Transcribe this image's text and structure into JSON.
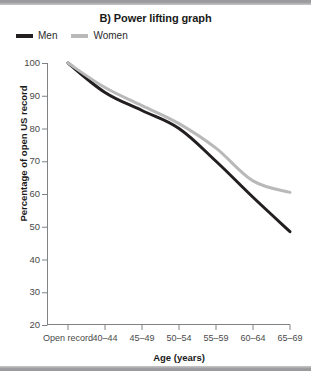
{
  "figure": {
    "background_color": "#ffffff",
    "border_bar_color": "#9b9b9e"
  },
  "title": "B) Power lifting graph",
  "legend": {
    "position": "top-left",
    "entries": [
      {
        "label": "Men",
        "color": "#231f20"
      },
      {
        "label": "Women",
        "color": "#b9b9b9"
      }
    ]
  },
  "axes": {
    "xlabel": "Age (years)",
    "ylabel": "Percentage of open US record",
    "ytick_labels": [
      "100",
      "90",
      "80",
      "70",
      "60",
      "50",
      "40",
      "30",
      "20"
    ],
    "xtick_labels": [
      "Open record",
      "40–44",
      "45–49",
      "50–54",
      "55–59",
      "60–64",
      "65–69"
    ]
  },
  "chart_data": {
    "type": "line",
    "title": "B) Power lifting graph",
    "xlabel": "Age (years)",
    "ylabel": "Percentage of open US record",
    "categories": [
      "Open record",
      "40–44",
      "45–49",
      "50–54",
      "55–59",
      "60–64",
      "65–69"
    ],
    "series": [
      {
        "name": "Men",
        "color": "#231f20",
        "values": [
          100,
          91,
          85.5,
          80,
          70,
          59,
          48.5
        ]
      },
      {
        "name": "Women",
        "color": "#b9b9b9",
        "values": [
          100,
          92.5,
          87,
          81.5,
          74,
          64,
          60.5
        ]
      }
    ],
    "ylim": [
      20,
      100
    ],
    "ytick_values": [
      100,
      90,
      80,
      70,
      60,
      50,
      40,
      30,
      20
    ],
    "grid": false,
    "legend_position": "top-left"
  }
}
